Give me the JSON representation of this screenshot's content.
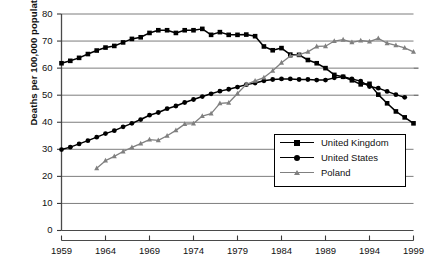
{
  "chart_data": {
    "type": "line",
    "title": "",
    "xlabel": "",
    "ylabel": "Deaths per 100,000 population",
    "xlim": [
      1959,
      1999
    ],
    "ylim": [
      0,
      80
    ],
    "ytick_labels": [
      "0",
      "10",
      "20",
      "30",
      "40",
      "50",
      "60",
      "70",
      "80"
    ],
    "yticks": [
      0,
      10,
      20,
      30,
      40,
      50,
      60,
      70,
      80
    ],
    "xtick_labels": [
      "1959",
      "1964",
      "1969",
      "1974",
      "1979",
      "1984",
      "1989",
      "1994",
      "1999"
    ],
    "xticks": [
      1959,
      1964,
      1969,
      1974,
      1979,
      1984,
      1989,
      1994,
      1999
    ],
    "grid": "horizontal",
    "legend_position": "lower-right",
    "series": [
      {
        "name": "United Kingdom",
        "marker": "square",
        "color": "#000000",
        "x": [
          1959,
          1960,
          1961,
          1962,
          1963,
          1964,
          1965,
          1966,
          1967,
          1968,
          1969,
          1970,
          1971,
          1972,
          1973,
          1974,
          1975,
          1976,
          1977,
          1978,
          1979,
          1980,
          1981,
          1982,
          1983,
          1984,
          1985,
          1986,
          1987,
          1988,
          1989,
          1990,
          1991,
          1992,
          1993,
          1994,
          1995,
          1996,
          1997,
          1998,
          1999
        ],
        "y": [
          61.8,
          62.7,
          63.8,
          65.2,
          66.5,
          67.6,
          68.2,
          69.5,
          70.8,
          71.4,
          73.0,
          74.0,
          74.0,
          73.0,
          74.0,
          74.0,
          74.5,
          72.3,
          73.3,
          72.3,
          72.3,
          72.4,
          71.8,
          68.0,
          66.6,
          67.4,
          65.0,
          64.9,
          63.0,
          61.8,
          60.0,
          57.5,
          56.8,
          55.5,
          54.0,
          54.2,
          50.2,
          47.0,
          44.0,
          41.8,
          39.6
        ]
      },
      {
        "name": "United States",
        "marker": "circle",
        "color": "#000000",
        "x": [
          1959,
          1960,
          1961,
          1962,
          1963,
          1964,
          1965,
          1966,
          1967,
          1968,
          1969,
          1970,
          1971,
          1972,
          1973,
          1974,
          1975,
          1976,
          1977,
          1978,
          1979,
          1980,
          1981,
          1982,
          1983,
          1984,
          1985,
          1986,
          1987,
          1988,
          1989,
          1990,
          1991,
          1992,
          1993,
          1994,
          1995,
          1996,
          1997,
          1998
        ],
        "y": [
          29.9,
          30.8,
          32.0,
          33.2,
          34.5,
          35.8,
          36.9,
          38.3,
          39.6,
          41.0,
          42.6,
          43.6,
          45.0,
          46.0,
          47.3,
          48.4,
          49.5,
          50.5,
          51.5,
          52.2,
          53.0,
          53.9,
          54.5,
          55.3,
          55.8,
          56.0,
          56.0,
          55.8,
          55.8,
          55.6,
          55.6,
          56.4,
          56.8,
          56.0,
          55.2,
          53.2,
          52.6,
          51.4,
          50.2,
          49.2
        ]
      },
      {
        "name": "Poland",
        "marker": "triangle",
        "color": "#808080",
        "x": [
          1963,
          1964,
          1965,
          1966,
          1967,
          1968,
          1969,
          1970,
          1971,
          1972,
          1973,
          1974,
          1975,
          1976,
          1977,
          1978,
          1979,
          1980,
          1981,
          1982,
          1983,
          1984,
          1985,
          1986,
          1987,
          1988,
          1989,
          1990,
          1991,
          1992,
          1993,
          1994,
          1995,
          1996,
          1997,
          1998,
          1999
        ],
        "y": [
          23.0,
          25.8,
          27.4,
          29.2,
          30.7,
          32.1,
          33.6,
          33.3,
          35.0,
          37.0,
          39.3,
          39.5,
          42.3,
          43.2,
          47.0,
          47.2,
          50.6,
          54.0,
          55.3,
          56.5,
          59.0,
          62.0,
          64.5,
          65.0,
          66.0,
          68.0,
          68.1,
          70.0,
          70.5,
          69.5,
          70.2,
          69.8,
          71.0,
          69.2,
          68.4,
          67.5,
          66.0
        ]
      }
    ]
  },
  "legend": {
    "entries": [
      {
        "label": "United Kingdom"
      },
      {
        "label": "United States"
      },
      {
        "label": "Poland"
      }
    ]
  }
}
